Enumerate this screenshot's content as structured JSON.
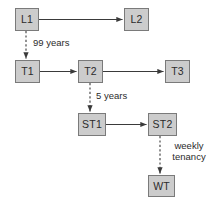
{
  "diagram": {
    "background_color": "#ffffff",
    "node_fill_color": "#cccccc",
    "node_border_color": "#7a7a7a",
    "line_color": "#3a3a3a",
    "nodes": [
      {
        "id": "L1",
        "label": "L1",
        "x": 15,
        "y": 8,
        "w": 24,
        "h": 23
      },
      {
        "id": "L2",
        "label": "L2",
        "x": 124,
        "y": 8,
        "w": 25,
        "h": 23
      },
      {
        "id": "T1",
        "label": "T1",
        "x": 15,
        "y": 60,
        "w": 25,
        "h": 23
      },
      {
        "id": "T2",
        "label": "T2",
        "x": 78,
        "y": 60,
        "w": 25,
        "h": 23
      },
      {
        "id": "T3",
        "label": "T3",
        "x": 165,
        "y": 60,
        "w": 25,
        "h": 23
      },
      {
        "id": "ST1",
        "label": "ST1",
        "x": 78,
        "y": 113,
        "w": 28,
        "h": 23
      },
      {
        "id": "ST2",
        "label": "ST2",
        "x": 148,
        "y": 113,
        "w": 29,
        "h": 23
      },
      {
        "id": "WT",
        "label": "WT",
        "x": 148,
        "y": 175,
        "w": 27,
        "h": 22
      }
    ],
    "edges": [
      {
        "id": "l1-l2",
        "from": "L1",
        "to": "L2",
        "style": "solid",
        "orientation": "horizontal",
        "label": ""
      },
      {
        "id": "l1-t1",
        "from": "L1",
        "to": "T1",
        "style": "dashed",
        "orientation": "vertical",
        "label": "99 years"
      },
      {
        "id": "t1-t2",
        "from": "T1",
        "to": "T2",
        "style": "solid",
        "orientation": "horizontal",
        "label": ""
      },
      {
        "id": "t2-t3",
        "from": "T2",
        "to": "T3",
        "style": "solid",
        "orientation": "horizontal",
        "label": ""
      },
      {
        "id": "t2-st1",
        "from": "T2",
        "to": "ST1",
        "style": "dashed",
        "orientation": "vertical",
        "label": "5 years"
      },
      {
        "id": "st1-st2",
        "from": "ST1",
        "to": "ST2",
        "style": "solid",
        "orientation": "horizontal",
        "label": ""
      },
      {
        "id": "st2-wt",
        "from": "ST2",
        "to": "WT",
        "style": "dashed",
        "orientation": "vertical",
        "label": "weekly tenancy"
      }
    ],
    "labels": {
      "ninety_nine_years": "99 years",
      "five_years": "5 years",
      "weekly_line1": "weekly",
      "weekly_line2": "tenancy"
    }
  }
}
